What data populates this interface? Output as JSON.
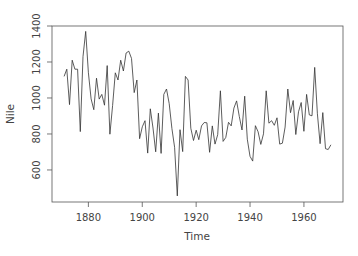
{
  "chart_data": {
    "type": "line",
    "title": "",
    "xlabel": "Time",
    "ylabel": "Nile",
    "x_ticks": [
      1880,
      1900,
      1920,
      1940,
      1960
    ],
    "y_ticks": [
      600,
      800,
      1000,
      1200,
      1400
    ],
    "xlim": [
      1866.5,
      1974.5
    ],
    "ylim": [
      422,
      1400
    ],
    "grid": false,
    "x_start": 1871,
    "values": [
      1120,
      1160,
      963,
      1210,
      1160,
      1160,
      813,
      1230,
      1370,
      1140,
      995,
      935,
      1110,
      994,
      1020,
      960,
      1180,
      799,
      958,
      1140,
      1100,
      1210,
      1150,
      1250,
      1260,
      1220,
      1030,
      1100,
      774,
      840,
      874,
      694,
      940,
      833,
      701,
      916,
      692,
      1020,
      1050,
      969,
      831,
      726,
      456,
      824,
      702,
      1120,
      1100,
      832,
      764,
      821,
      768,
      845,
      864,
      862,
      698,
      845,
      744,
      796,
      1040,
      759,
      781,
      865,
      845,
      944,
      984,
      897,
      822,
      1010,
      771,
      676,
      649,
      846,
      812,
      742,
      801,
      1040,
      860,
      874,
      848,
      890,
      744,
      749,
      838,
      1050,
      918,
      986,
      797,
      923,
      975,
      815,
      1020,
      906,
      901,
      1170,
      912,
      746,
      919,
      718,
      714,
      740
    ]
  }
}
